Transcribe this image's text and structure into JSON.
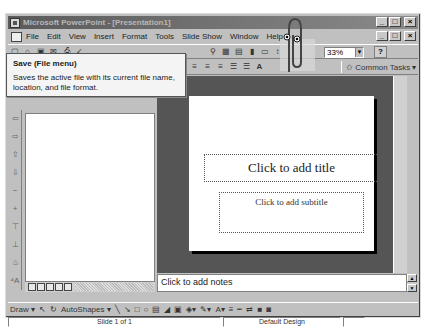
{
  "window": {
    "title": "Microsoft PowerPoint - [Presentation1]",
    "controls": [
      "_",
      "□",
      "×"
    ]
  },
  "menubar": {
    "items": [
      {
        "label": "File",
        "accel": "F"
      },
      {
        "label": "Edit",
        "accel": "E"
      },
      {
        "label": "View",
        "accel": "V"
      },
      {
        "label": "Insert",
        "accel": "I"
      },
      {
        "label": "Format",
        "accel": "o"
      },
      {
        "label": "Tools",
        "accel": "T"
      },
      {
        "label": "Slide Show",
        "accel": "d"
      },
      {
        "label": "Window",
        "accel": "W"
      },
      {
        "label": "Help",
        "accel": "H"
      }
    ]
  },
  "standard_toolbar": {
    "zoom_value": "33%",
    "help_icon": "?"
  },
  "formatting_toolbar": {
    "common_tasks_label": "Common Tasks"
  },
  "tooltip": {
    "title": "Save (File menu)",
    "body": "Saves the active file with its current file name, location, and file format."
  },
  "slide": {
    "title_placeholder": "Click to add title",
    "subtitle_placeholder": "Click to add subtitle"
  },
  "notes": {
    "placeholder": "Click to add notes"
  },
  "drawing_toolbar": {
    "draw_label": "Draw",
    "autoshapes_label": "AutoShapes"
  },
  "statusbar": {
    "slide_info": "Slide 1 of 1",
    "design": "Default Design"
  }
}
